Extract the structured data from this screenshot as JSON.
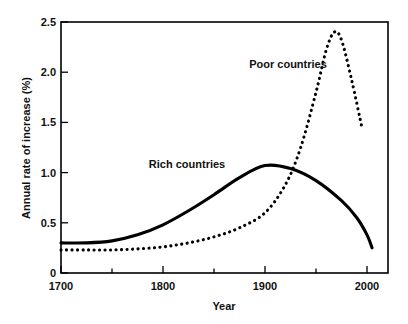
{
  "chart_data": {
    "type": "line",
    "title": "",
    "xlabel": "Year",
    "ylabel": "Annual rate of increase (%)",
    "xlim": [
      1700,
      2010
    ],
    "ylim": [
      0,
      2.5
    ],
    "grid": false,
    "legend_position": "inline-annotations",
    "x_ticks_major": [
      1700,
      1800,
      1900,
      2000
    ],
    "x_tick_labels": [
      "1700",
      "1800",
      "1900",
      "2000"
    ],
    "x_ticks_minor": [
      1750,
      1850,
      1950
    ],
    "y_ticks": [
      0,
      0.5,
      1.0,
      1.5,
      2.0,
      2.5
    ],
    "y_tick_labels": [
      "0",
      "0.5",
      "1.0",
      "1.5",
      "2.0",
      "2.5"
    ],
    "series": [
      {
        "name": "Rich countries",
        "style": "solid",
        "color": "#000000",
        "annotation": "Rich countries",
        "x": [
          1700,
          1725,
          1750,
          1775,
          1800,
          1825,
          1850,
          1875,
          1900,
          1925,
          1950,
          1975,
          1990,
          2000,
          2005
        ],
        "values": [
          0.3,
          0.3,
          0.32,
          0.38,
          0.48,
          0.62,
          0.78,
          0.95,
          1.07,
          1.04,
          0.92,
          0.72,
          0.55,
          0.38,
          0.25
        ]
      },
      {
        "name": "Poor countries",
        "style": "dotted",
        "color": "#000000",
        "annotation": "Poor countries",
        "x": [
          1700,
          1725,
          1750,
          1775,
          1800,
          1825,
          1850,
          1875,
          1900,
          1920,
          1935,
          1950,
          1960,
          1968,
          1975,
          1985,
          1995
        ],
        "values": [
          0.23,
          0.23,
          0.23,
          0.24,
          0.26,
          0.3,
          0.36,
          0.45,
          0.6,
          0.88,
          1.25,
          1.8,
          2.22,
          2.4,
          2.32,
          1.92,
          1.45
        ]
      }
    ],
    "annotations": [
      {
        "text": "Poor countries",
        "x_year": 1905,
        "y_value": 2.04
      },
      {
        "text": "Rich countries",
        "x_year": 1805,
        "y_value": 1.17
      }
    ]
  },
  "axis": {
    "y_title": "Annual rate of increase (%)",
    "x_title": "Year",
    "y_labels": {
      "t0": "0",
      "t1": "0.5",
      "t2": "1.0",
      "t3": "1.5",
      "t4": "2.0",
      "t5": "2.5"
    },
    "x_labels": {
      "t1700": "1700",
      "t1800": "1800",
      "t1900": "1900",
      "t2000": "2000"
    }
  },
  "labels": {
    "poor": "Poor countries",
    "rich": "Rich countries"
  }
}
